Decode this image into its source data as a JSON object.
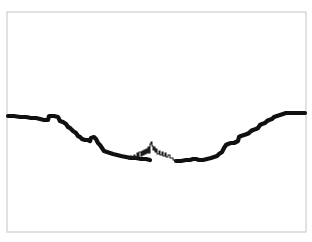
{
  "figure": {
    "width": 312,
    "height": 242,
    "background_color": "#ffffff",
    "frame": {
      "name": "plot-frame",
      "x": 7,
      "y": 12,
      "width": 299,
      "height": 220,
      "stroke_color": "#c9c9c9",
      "fill_color": "#ffffff",
      "stroke_width": 1.1
    }
  },
  "chart_data": {
    "type": "line",
    "title": "",
    "subtitle": "",
    "xlabel": "",
    "ylabel": "",
    "xlim": [
      0,
      312
    ],
    "ylim": [
      242,
      0
    ],
    "grid": false,
    "legend": null,
    "legend_position": "none",
    "xticks": [],
    "yticks": [],
    "xticklabels": [],
    "yticklabels": [],
    "annotations": [],
    "series": [
      {
        "name": "profile-main",
        "style": "thick-step-line",
        "color": "#101010",
        "linewidth": 4.2,
        "points": [
          [
            8,
            116
          ],
          [
            14,
            116
          ],
          [
            20,
            117
          ],
          [
            26,
            117
          ],
          [
            31,
            118
          ],
          [
            36,
            118
          ],
          [
            40,
            119
          ],
          [
            44,
            120
          ],
          [
            48,
            120
          ],
          [
            49,
            116
          ],
          [
            54,
            116
          ],
          [
            58,
            117
          ],
          [
            60,
            121
          ],
          [
            63,
            122
          ],
          [
            66,
            124
          ],
          [
            68,
            127
          ],
          [
            70,
            128
          ],
          [
            73,
            131
          ],
          [
            76,
            133
          ],
          [
            78,
            136
          ],
          [
            80,
            137
          ],
          [
            82,
            139
          ],
          [
            85,
            140
          ],
          [
            88,
            140
          ],
          [
            90,
            141
          ],
          [
            91,
            138
          ],
          [
            94,
            137
          ],
          [
            96,
            139
          ],
          [
            98,
            143
          ],
          [
            100,
            145
          ],
          [
            102,
            148
          ],
          [
            104,
            151
          ],
          [
            107,
            152
          ],
          [
            110,
            153
          ],
          [
            113,
            154
          ],
          [
            117,
            155
          ],
          [
            121,
            156
          ],
          [
            126,
            157
          ],
          [
            131,
            158
          ],
          [
            136,
            158
          ],
          [
            141,
            159
          ],
          [
            146,
            159
          ],
          [
            150,
            160
          ]
        ]
      },
      {
        "name": "profile-center-detail",
        "style": "thin-jagged-skyline",
        "color": "#1a1a1a",
        "linewidth": 1.05,
        "points": [
          [
            128,
            159
          ],
          [
            130,
            159
          ],
          [
            130,
            156
          ],
          [
            132,
            156
          ],
          [
            132,
            158
          ],
          [
            134,
            158
          ],
          [
            134,
            155
          ],
          [
            135,
            155
          ],
          [
            135,
            157
          ],
          [
            137,
            157
          ],
          [
            137,
            153
          ],
          [
            138,
            153
          ],
          [
            138,
            157
          ],
          [
            139,
            157
          ],
          [
            139,
            152
          ],
          [
            141,
            152
          ],
          [
            141,
            156
          ],
          [
            142,
            156
          ],
          [
            142,
            151
          ],
          [
            143,
            151
          ],
          [
            143,
            155
          ],
          [
            144,
            155
          ],
          [
            144,
            150
          ],
          [
            145,
            150
          ],
          [
            145,
            154
          ],
          [
            146,
            154
          ],
          [
            146,
            149
          ],
          [
            147,
            149
          ],
          [
            147,
            153
          ],
          [
            148,
            153
          ],
          [
            148,
            147
          ],
          [
            149,
            147
          ],
          [
            149,
            153
          ],
          [
            150,
            153
          ],
          [
            150,
            144
          ],
          [
            151,
            144
          ],
          [
            151,
            142
          ],
          [
            152,
            142
          ],
          [
            152,
            146
          ],
          [
            153,
            146
          ],
          [
            153,
            150
          ],
          [
            154,
            150
          ],
          [
            154,
            147
          ],
          [
            155,
            147
          ],
          [
            155,
            152
          ],
          [
            156,
            152
          ],
          [
            156,
            149
          ],
          [
            157,
            149
          ],
          [
            157,
            154
          ],
          [
            159,
            154
          ],
          [
            159,
            151
          ],
          [
            160,
            151
          ],
          [
            160,
            155
          ],
          [
            162,
            155
          ],
          [
            162,
            152
          ],
          [
            163,
            152
          ],
          [
            163,
            156
          ],
          [
            165,
            156
          ],
          [
            165,
            153
          ],
          [
            166,
            153
          ],
          [
            166,
            157
          ],
          [
            168,
            157
          ],
          [
            168,
            155
          ],
          [
            170,
            155
          ],
          [
            170,
            158
          ],
          [
            173,
            158
          ],
          [
            173,
            160
          ],
          [
            178,
            160
          ]
        ]
      },
      {
        "name": "profile-right",
        "style": "thick-step-line",
        "color": "#101010",
        "linewidth": 4.2,
        "points": [
          [
            176,
            161
          ],
          [
            181,
            161
          ],
          [
            186,
            160
          ],
          [
            190,
            160
          ],
          [
            193,
            159
          ],
          [
            196,
            159
          ],
          [
            199,
            160
          ],
          [
            203,
            160
          ],
          [
            207,
            159
          ],
          [
            211,
            158
          ],
          [
            214,
            157
          ],
          [
            217,
            156
          ],
          [
            219,
            154
          ],
          [
            222,
            152
          ],
          [
            224,
            148
          ],
          [
            226,
            145
          ],
          [
            228,
            144
          ],
          [
            231,
            143
          ],
          [
            234,
            143
          ],
          [
            236,
            142
          ],
          [
            238,
            141
          ],
          [
            239,
            137
          ],
          [
            241,
            136
          ],
          [
            244,
            135
          ],
          [
            247,
            134
          ],
          [
            249,
            133
          ],
          [
            251,
            131
          ],
          [
            253,
            130
          ],
          [
            256,
            129
          ],
          [
            258,
            128
          ],
          [
            260,
            125
          ],
          [
            262,
            124
          ],
          [
            265,
            123
          ],
          [
            267,
            121
          ],
          [
            269,
            120
          ],
          [
            272,
            119
          ],
          [
            274,
            117
          ],
          [
            277,
            116
          ],
          [
            280,
            115
          ],
          [
            283,
            114
          ],
          [
            286,
            113
          ],
          [
            289,
            113
          ],
          [
            292,
            113
          ],
          [
            296,
            113
          ],
          [
            300,
            113
          ],
          [
            305,
            113
          ]
        ]
      }
    ]
  }
}
